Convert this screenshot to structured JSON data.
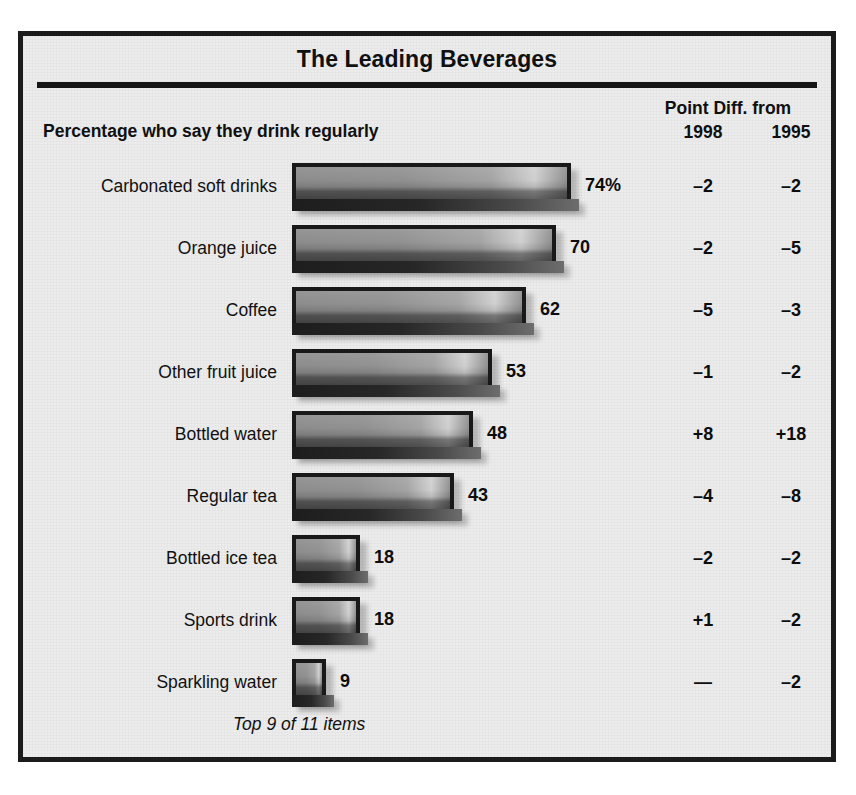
{
  "title": "The Leading Beverages",
  "subhead": "Percentage who say they drink regularly",
  "diff_group_label": "Point Diff. from",
  "col_1998": "1998",
  "col_1995": "1995",
  "footnote": "Top 9 of 11 items",
  "colors": {
    "frame": "#1b1b1b",
    "panel_bg": "#ececec",
    "bar_fill": "#8f8f8f",
    "bar_outline": "#191919",
    "text": "#111111"
  },
  "chart_data": {
    "type": "bar",
    "orientation": "horizontal",
    "title": "The Leading Beverages",
    "subtitle": "Percentage who say they drink regularly",
    "xlabel": "",
    "ylabel": "",
    "xlim": [
      0,
      74
    ],
    "grid": false,
    "legend": null,
    "value_suffix_first": "%",
    "categories": [
      "Carbonated soft drinks",
      "Orange juice",
      "Coffee",
      "Other fruit juice",
      "Bottled water",
      "Regular tea",
      "Bottled ice tea",
      "Sports drink",
      "Sparkling water"
    ],
    "values": [
      74,
      70,
      62,
      53,
      48,
      43,
      18,
      18,
      9
    ],
    "value_labels": [
      "74%",
      "70",
      "62",
      "53",
      "48",
      "43",
      "18",
      "18",
      "9"
    ],
    "series": [
      {
        "name": "Percentage who say they drink regularly",
        "values": [
          74,
          70,
          62,
          53,
          48,
          43,
          18,
          18,
          9
        ]
      },
      {
        "name": "Point Diff. from 1998",
        "values": [
          -2,
          -2,
          -5,
          -1,
          8,
          -4,
          -2,
          1,
          null
        ],
        "labels": [
          "–2",
          "–2",
          "–5",
          "–1",
          "+8",
          "–4",
          "–2",
          "+1",
          "—"
        ]
      },
      {
        "name": "Point Diff. from 1995",
        "values": [
          -2,
          -5,
          -3,
          -2,
          18,
          -8,
          -2,
          -2,
          -2
        ],
        "labels": [
          "–2",
          "–5",
          "–3",
          "–2",
          "+18",
          "–8",
          "–2",
          "–2",
          "–2"
        ]
      }
    ],
    "annotations": [
      "Top 9 of 11 items"
    ]
  },
  "rows": [
    {
      "label": "Carbonated soft drinks",
      "value": 74,
      "value_label": "74%",
      "d98": "–2",
      "d95": "–2"
    },
    {
      "label": "Orange juice",
      "value": 70,
      "value_label": "70",
      "d98": "–2",
      "d95": "–5"
    },
    {
      "label": "Coffee",
      "value": 62,
      "value_label": "62",
      "d98": "–5",
      "d95": "–3"
    },
    {
      "label": "Other fruit juice",
      "value": 53,
      "value_label": "53",
      "d98": "–1",
      "d95": "–2"
    },
    {
      "label": "Bottled water",
      "value": 48,
      "value_label": "48",
      "d98": "+8",
      "d95": "+18"
    },
    {
      "label": "Regular tea",
      "value": 43,
      "value_label": "43",
      "d98": "–4",
      "d95": "–8"
    },
    {
      "label": "Bottled ice tea",
      "value": 18,
      "value_label": "18",
      "d98": "–2",
      "d95": "–2"
    },
    {
      "label": "Sports drink",
      "value": 18,
      "value_label": "18",
      "d98": "+1",
      "d95": "–2"
    },
    {
      "label": "Sparkling water",
      "value": 9,
      "value_label": "9",
      "d98": "—",
      "d95": "–2"
    }
  ]
}
